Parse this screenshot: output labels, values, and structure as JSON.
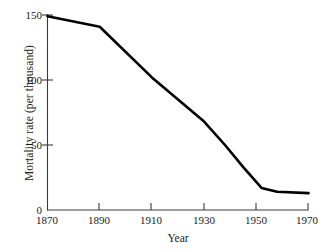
{
  "chart_data": {
    "type": "line",
    "title": "",
    "subtitle": "",
    "xlabel": "Year",
    "ylabel": "Mortality rate (per thousand)",
    "xlim": [
      1870,
      1970
    ],
    "ylim": [
      0,
      150
    ],
    "xticks": [
      1870,
      1890,
      1910,
      1930,
      1950,
      1970
    ],
    "xtick_labels": [
      "1870",
      "1890",
      "1910",
      "1930",
      "1950",
      "1970"
    ],
    "yticks": [
      0,
      50,
      100,
      150
    ],
    "ytick_labels": [
      "0",
      "50",
      "100",
      "150"
    ],
    "grid": false,
    "legend": null,
    "annotations": [],
    "series": [
      {
        "name": "Mortality rate",
        "color": "#000000",
        "line_width": 2.6,
        "x": [
          1870,
          1890,
          1910,
          1930,
          1938,
          1945,
          1952,
          1958,
          1970
        ],
        "values": [
          149,
          141,
          102,
          68,
          50,
          33,
          17,
          14,
          13
        ]
      }
    ]
  },
  "axes": {
    "x_axis_name": "year-axis",
    "y_axis_name": "mortality-axis",
    "tick_color": "#3a3a3a",
    "axis_color": "#3a3a3a"
  }
}
